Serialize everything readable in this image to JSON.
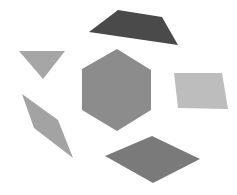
{
  "canvas": {
    "width": 237,
    "height": 195,
    "background": "#ffffff"
  },
  "shapes": [
    {
      "id": "trapezoid-top",
      "type": "trapezoid",
      "color": "#4a4a4a",
      "points": "89,32 118,10 162,17 178,45"
    },
    {
      "id": "triangle-left",
      "type": "triangle",
      "color": "#a6a6a6",
      "points": "19,51 65,51 43,79"
    },
    {
      "id": "hexagon-center",
      "type": "hexagon",
      "color": "#8c8c8c",
      "points": "117,49 151,70 151,110 117,131 82,110 82,69"
    },
    {
      "id": "parallelogram-right",
      "type": "parallelogram",
      "color": "#bdbdbd",
      "points": "174,73 222,73 228,109 178,108"
    },
    {
      "id": "rhombus-left",
      "type": "rhombus",
      "color": "#a3a3a3",
      "points": "22,94 58,120 73,158 34,128"
    },
    {
      "id": "rhombus-bottom",
      "type": "rhombus",
      "color": "#7a7a7a",
      "points": "105,156 152,136 200,159 153,183"
    }
  ]
}
